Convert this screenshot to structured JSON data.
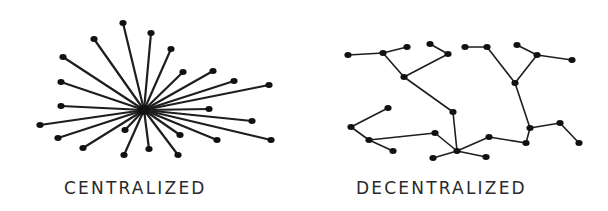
{
  "figure": {
    "line_color": "#1e1e1e",
    "node_color": "#111111",
    "background": "#ffffff"
  },
  "centralized": {
    "label": "CENTRALIZED",
    "hub": [
      144,
      110
    ],
    "nodes": [
      [
        123,
        23
      ],
      [
        151,
        33
      ],
      [
        94,
        39
      ],
      [
        171,
        49
      ],
      [
        63,
        57
      ],
      [
        183,
        72
      ],
      [
        213,
        71
      ],
      [
        61,
        82
      ],
      [
        234,
        81
      ],
      [
        269,
        85
      ],
      [
        61,
        106
      ],
      [
        209,
        109
      ],
      [
        40,
        125
      ],
      [
        252,
        121
      ],
      [
        58,
        138
      ],
      [
        125,
        130
      ],
      [
        180,
        135
      ],
      [
        83,
        148
      ],
      [
        217,
        140
      ],
      [
        271,
        140
      ],
      [
        124,
        155
      ],
      [
        149,
        149
      ],
      [
        178,
        155
      ]
    ]
  },
  "decentralized": {
    "label": "DECENTRALIZED",
    "nodes": {
      "a": [
        348,
        55
      ],
      "b": [
        383,
        53
      ],
      "c": [
        407,
        47
      ],
      "d": [
        404,
        77
      ],
      "e": [
        430,
        44
      ],
      "f": [
        448,
        54
      ],
      "g": [
        453,
        112
      ],
      "h": [
        457,
        151
      ],
      "i": [
        433,
        158
      ],
      "j": [
        486,
        157
      ],
      "k": [
        489,
        137
      ],
      "l": [
        526,
        143
      ],
      "m": [
        530,
        128
      ],
      "n": [
        560,
        123
      ],
      "o": [
        579,
        143
      ],
      "p": [
        515,
        83
      ],
      "q": [
        487,
        47
      ],
      "r": [
        465,
        47
      ],
      "s": [
        537,
        55
      ],
      "t": [
        517,
        45
      ],
      "u": [
        572,
        60
      ],
      "v": [
        435,
        133
      ],
      "w": [
        351,
        127
      ],
      "x": [
        388,
        108
      ],
      "y": [
        369,
        140
      ],
      "z": [
        393,
        151
      ]
    },
    "edges": [
      [
        "a",
        "b"
      ],
      [
        "b",
        "c"
      ],
      [
        "b",
        "d"
      ],
      [
        "d",
        "f"
      ],
      [
        "e",
        "f"
      ],
      [
        "d",
        "g"
      ],
      [
        "g",
        "h"
      ],
      [
        "h",
        "i"
      ],
      [
        "h",
        "j"
      ],
      [
        "h",
        "k"
      ],
      [
        "k",
        "l"
      ],
      [
        "l",
        "m"
      ],
      [
        "m",
        "n"
      ],
      [
        "n",
        "o"
      ],
      [
        "m",
        "p"
      ],
      [
        "p",
        "q"
      ],
      [
        "q",
        "r"
      ],
      [
        "p",
        "s"
      ],
      [
        "s",
        "t"
      ],
      [
        "s",
        "u"
      ],
      [
        "h",
        "v"
      ],
      [
        "v",
        "y"
      ],
      [
        "y",
        "w"
      ],
      [
        "w",
        "x"
      ],
      [
        "y",
        "z"
      ]
    ]
  }
}
